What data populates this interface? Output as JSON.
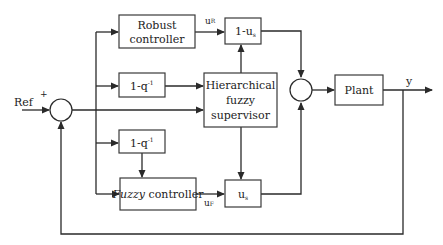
{
  "diagram": {
    "blocks": {
      "robust_controller": {
        "line1": "Robust",
        "line2": "controller"
      },
      "one_minus_us": {
        "label": "1-u",
        "sub": "s"
      },
      "diff_top": {
        "label": "1-q",
        "sup": "-1"
      },
      "supervisor": {
        "line1": "Hierarchical",
        "line2": "fuzzy",
        "line3": "supervisor"
      },
      "plant": {
        "label": "Plant"
      },
      "diff_bottom": {
        "label": "1-q",
        "sup": "-1"
      },
      "fuzzy_controller": {
        "italic": "Fuzzy",
        "rest": " controller"
      },
      "us": {
        "label": "u",
        "sub": "s"
      }
    },
    "signals": {
      "ref": "Ref",
      "plus": "+",
      "uR": {
        "label": "u",
        "sub": "R"
      },
      "uF": {
        "label": "u",
        "sub": "F"
      },
      "y": "y"
    },
    "nodes": {
      "error_junction": "summing junction (Ref − y)",
      "output_junction": "summing junction (control sum)"
    }
  }
}
